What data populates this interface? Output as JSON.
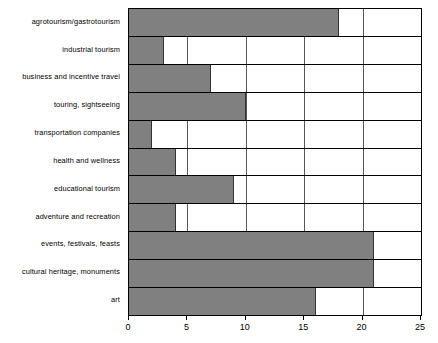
{
  "chart_data": {
    "type": "bar",
    "orientation": "horizontal",
    "title": "",
    "subtitle": "",
    "xlabel": "",
    "ylabel": "",
    "xlim": [
      0,
      25
    ],
    "xticks": [
      0,
      5,
      10,
      15,
      20,
      25
    ],
    "grid": true,
    "legend": null,
    "legend_position": "none",
    "bar_color": "#808080",
    "bar_edge_color": "#333333",
    "axis_color": "#000000",
    "gridline_color": "#555555",
    "background_color": "#ffffff",
    "categories": [
      "agrotourism/gastrotourism",
      "industrial tourism",
      "business and incentive travel",
      "touring, sightseeing",
      "transportation companies",
      "health and wellness",
      "educational tourism",
      "adventure and recreation",
      "events, festivals, feasts",
      "cultural heritage, monuments",
      "art"
    ],
    "values": [
      18,
      3,
      7,
      10,
      2,
      4,
      9,
      4,
      21,
      21,
      16
    ],
    "series": [
      {
        "name": "",
        "values": [
          18,
          3,
          7,
          10,
          2,
          4,
          9,
          4,
          21,
          21,
          16
        ]
      }
    ]
  }
}
